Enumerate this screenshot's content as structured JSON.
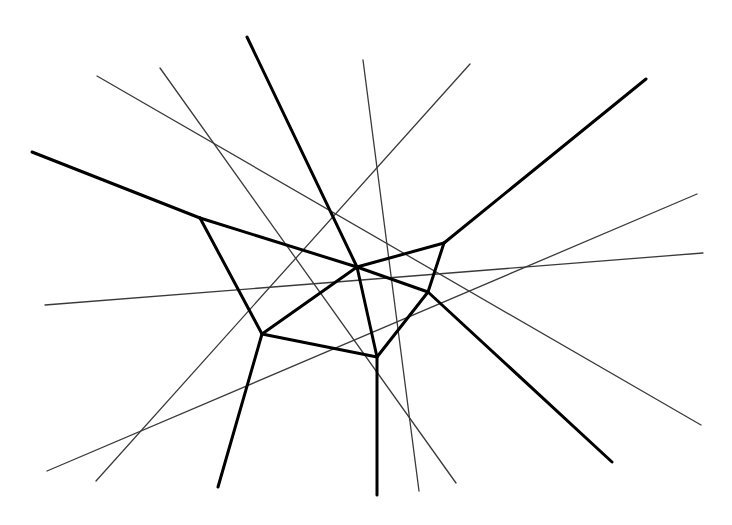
{
  "diagram": {
    "width": 732,
    "height": 525,
    "background": "#ffffff",
    "thick_color": "#000000",
    "thin_color": "#3a3a3a",
    "thick_width": 3,
    "thin_width": 1.3,
    "thick_edges": [
      [
        32,
        152,
        200,
        218
      ],
      [
        200,
        218,
        357,
        267
      ],
      [
        357,
        267,
        428,
        292
      ],
      [
        428,
        292,
        612,
        462
      ],
      [
        200,
        218,
        262,
        334
      ],
      [
        262,
        334,
        218,
        487
      ],
      [
        262,
        334,
        357,
        267
      ],
      [
        357,
        267,
        444,
        243
      ],
      [
        444,
        243,
        646,
        79
      ],
      [
        247,
        37,
        357,
        267
      ],
      [
        357,
        267,
        377,
        357
      ],
      [
        377,
        357,
        377,
        495
      ],
      [
        262,
        334,
        377,
        357
      ],
      [
        377,
        357,
        428,
        292
      ],
      [
        428,
        292,
        444,
        243
      ]
    ],
    "thin_lines": [
      [
        97,
        76,
        701,
        425
      ],
      [
        160,
        68,
        456,
        483
      ],
      [
        363,
        60,
        419,
        491
      ],
      [
        470,
        64,
        96,
        481
      ],
      [
        45,
        305,
        703,
        253
      ],
      [
        47,
        471,
        697,
        194
      ]
    ]
  }
}
